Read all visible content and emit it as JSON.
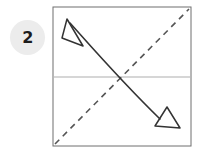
{
  "diagram": {
    "step_badge": {
      "label": "2",
      "shape": "circle",
      "fill_color": "#ececec",
      "text_color": "#1c1c1c",
      "center": [
        27.5,
        37.5
      ],
      "radius": 17.5
    },
    "sheet": {
      "name": "square-sheet",
      "shape": "square",
      "x": 53,
      "y": 7,
      "width": 138,
      "height": 139,
      "stroke_color": "#6f6f6f",
      "stroke_width": 1,
      "fill": "none"
    },
    "horizontal_line": {
      "name": "center-horizontal-line",
      "x1": 54,
      "y1": 77,
      "x2": 190,
      "y2": 77,
      "stroke_color": "#c9c9c9",
      "stroke_width": 1.4,
      "style": "solid"
    },
    "fold_line": {
      "name": "diagonal-fold-line",
      "x1": 55,
      "y1": 144,
      "x2": 189,
      "y2": 9,
      "stroke_color": "#555555",
      "stroke_width": 1.6,
      "style": "dashed",
      "dash_pattern": "6 5"
    },
    "motion_arrow": {
      "name": "curved-motion-arrow",
      "path": "M 70 23 C 96 52, 122 82, 160 119",
      "stroke_color": "#333333",
      "stroke_width": 1.6,
      "fill": "none",
      "arrowheads": [
        {
          "name": "arrowhead-upper-left",
          "tip": [
            67,
            19
          ],
          "style": "open-triangle",
          "direction": "up-left",
          "points": "67,19 83,46 62,38"
        },
        {
          "name": "arrowhead-lower-right",
          "tip": [
            180,
            128
          ],
          "style": "open-triangle",
          "direction": "down-right",
          "points": "180,128 155,126 167,107"
        }
      ]
    },
    "background_color": "#ffffff"
  }
}
